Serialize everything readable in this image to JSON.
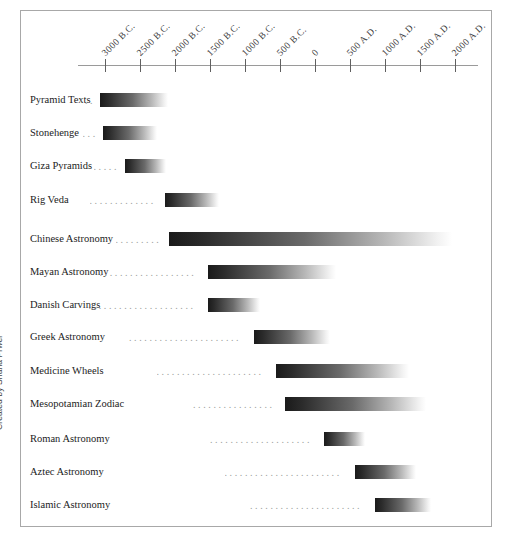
{
  "credit": {
    "text": "Created by Shana Prwer"
  },
  "chart_data": {
    "type": "bar",
    "title": "",
    "subtitle": "",
    "xlabel": "",
    "ylabel": "",
    "orientation": "horizontal",
    "grid": false,
    "legend": null,
    "axis": {
      "tick_labels": [
        "3000 B.C.",
        "2500 B.C.",
        "2000 B.C.",
        "1500 B.C.",
        "1000 B.C.",
        "500 B.C.",
        "0",
        "500 A.D.",
        "1000 A.D.",
        "1500 A.D.",
        "2000 A.D."
      ],
      "tick_values": [
        -3000,
        -2500,
        -2000,
        -1500,
        -1000,
        -500,
        0,
        500,
        1000,
        1500,
        2000
      ],
      "xlim": [
        -3000,
        2000
      ],
      "tick_x_px": [
        105,
        140,
        175,
        210,
        245,
        280,
        315,
        350,
        385,
        420,
        455
      ],
      "axis_left_px": 78,
      "axis_right_px": 478,
      "label_rotation_deg": -45
    },
    "categories": [
      "Pyramid Texts",
      "Stonehenge",
      "Giza Pyramids",
      "Rig Veda",
      "Chinese Astronomy",
      "Mayan Astronomy",
      "Danish Carvings",
      "Greek Astronomy",
      "Medicine Wheels",
      "Mesopotamian Zodiac",
      "Roman Astronomy",
      "Aztec Astronomy",
      "Islamic Astronomy"
    ],
    "bars": [
      {
        "label": "Pyramid Texts",
        "start": -3000,
        "end": -2050,
        "start_px": 100,
        "end_px": 168,
        "row_top_px": 89,
        "leader_dots": 2
      },
      {
        "label": "Stonehenge",
        "start": -2950,
        "end": -2250,
        "start_px": 103,
        "end_px": 157,
        "row_top_px": 122,
        "leader_dots": 3
      },
      {
        "label": "Giza Pyramids",
        "start": -2600,
        "end": -2050,
        "start_px": 125,
        "end_px": 166,
        "row_top_px": 155,
        "leader_dots": 5
      },
      {
        "label": "Rig Veda",
        "start": -2050,
        "end": -1300,
        "start_px": 165,
        "end_px": 219,
        "row_top_px": 189,
        "leader_dots": 13
      },
      {
        "label": "Chinese Astronomy",
        "start": -2000,
        "end": 1950,
        "start_px": 169,
        "end_px": 452,
        "row_top_px": 228,
        "leader_dots": 9
      },
      {
        "label": "Mayan Astronomy",
        "start": -1450,
        "end": 350,
        "start_px": 208,
        "end_px": 336,
        "row_top_px": 261,
        "leader_dots": 19
      },
      {
        "label": "Danish Carvings",
        "start": -1450,
        "end": -730,
        "start_px": 208,
        "end_px": 260,
        "row_top_px": 294,
        "leader_dots": 21
      },
      {
        "label": "Greek Astronomy",
        "start": -1100,
        "end": -70,
        "start_px": 254,
        "end_px": 330,
        "row_top_px": 326,
        "leader_dots": 22
      },
      {
        "label": "Medicine Wheels",
        "start": -800,
        "end": 1080,
        "start_px": 276,
        "end_px": 409,
        "row_top_px": 360,
        "leader_dots": 21
      },
      {
        "label": "Mesopotamian Zodiac",
        "start": -680,
        "end": 1320,
        "start_px": 285,
        "end_px": 426,
        "row_top_px": 393,
        "leader_dots": 16
      },
      {
        "label": "Roman Astronomy",
        "start": 120,
        "end": 680,
        "start_px": 324,
        "end_px": 365,
        "row_top_px": 428,
        "leader_dots": 20
      },
      {
        "label": "Aztec Astronomy",
        "start": 550,
        "end": 1400,
        "start_px": 355,
        "end_px": 416,
        "row_top_px": 461,
        "leader_dots": 23
      },
      {
        "label": "Islamic Astronomy",
        "start": 810,
        "end": 1590,
        "start_px": 375,
        "end_px": 431,
        "row_top_px": 494,
        "leader_dots": 22
      }
    ],
    "colors": {
      "bar_start": "#1a1a1a",
      "bar_end": "#ffffff",
      "axis": "#9a9a9a",
      "tick": "#606060",
      "text": "#1c1c1c",
      "leader": "#9d9d9d",
      "frame": "#a8a8a8",
      "background": "#ffffff"
    }
  }
}
